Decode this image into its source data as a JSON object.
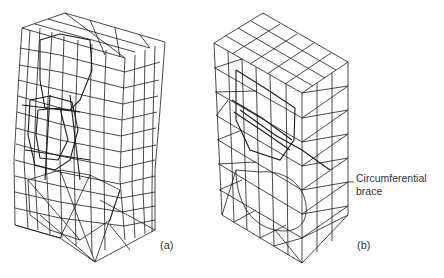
{
  "figure": {
    "panels": [
      {
        "id": "a",
        "label": "(a)",
        "description": "Deformed finite element mesh (wireframe)"
      },
      {
        "id": "b",
        "label": "(b)",
        "description": "Finite element mesh with circumferential brace (wireframe)"
      }
    ],
    "annotations": {
      "brace_label_line1": "Circumferential",
      "brace_label_line2": "brace"
    },
    "colors": {
      "line": "#1a1a1a",
      "background": "#ffffff",
      "text": "#333333"
    }
  }
}
